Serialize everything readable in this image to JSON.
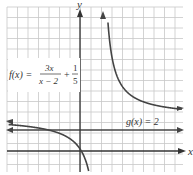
{
  "figure": {
    "axes": {
      "x_label": "x",
      "y_label": "y",
      "x_range": [
        -7,
        10
      ],
      "y_range": [
        -2,
        14
      ],
      "grid": true,
      "grid_step": 1
    },
    "functions": [
      {
        "name": "f",
        "label_lhs": "f(x) =",
        "label_frac1_num": "3x",
        "label_frac1_den": "x − 2",
        "label_plus": "+",
        "label_frac2_num": "1",
        "label_frac2_den": "5",
        "expression": "3x/(x-2) + 1/5",
        "vertical_asymptote": 2,
        "horizontal_asymptote": 3.2,
        "color": "#444444"
      },
      {
        "name": "g",
        "label": "g(x) = 2",
        "expression": "2",
        "color": "#444444"
      }
    ],
    "colors": {
      "grid": "#c8c8c8",
      "axis": "#333333",
      "curve": "#444444",
      "text": "#333333"
    }
  }
}
